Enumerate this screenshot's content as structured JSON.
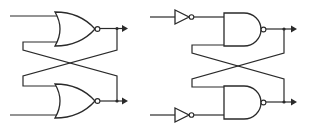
{
  "diagram": {
    "title": "",
    "colors": {
      "stroke": "#2a2a2a",
      "background": "#ffffff"
    },
    "circuits": [
      {
        "name": "NOR SR latch",
        "gates": [
          {
            "type": "NOR",
            "position": "top",
            "outputs": "inverted bubble",
            "output_arrow": true
          },
          {
            "type": "NOR",
            "position": "bottom",
            "outputs": "inverted bubble",
            "output_arrow": true
          }
        ],
        "cross_coupled_feedback": true
      },
      {
        "name": "NAND SR latch with inverted inputs",
        "gates": [
          {
            "type": "NOT",
            "position": "top-input"
          },
          {
            "type": "NAND",
            "position": "top",
            "outputs": "inverted bubble",
            "output_arrow": true
          },
          {
            "type": "NOT",
            "position": "bottom-input"
          },
          {
            "type": "NAND",
            "position": "bottom",
            "outputs": "inverted bubble",
            "output_arrow": true
          }
        ],
        "cross_coupled_feedback": true
      }
    ]
  }
}
